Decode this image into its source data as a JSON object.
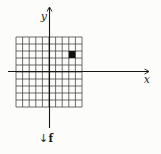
{
  "figure": {
    "background_color": "#fcfcfb",
    "grid_line_color": "#3d3d3d",
    "axis_color": "#161616",
    "labels": {
      "x_axis": "x",
      "y_axis": "y",
      "map_arrow": "↓",
      "map_function": "f"
    },
    "grid": {
      "columns": 10,
      "rows": 10,
      "x_range": [
        -5,
        5
      ],
      "y_range": [
        -5,
        5
      ]
    },
    "filled_cell": {
      "x_min": 3,
      "x_max": 4,
      "y_min": 2,
      "y_max": 3,
      "color": "#121212"
    }
  }
}
